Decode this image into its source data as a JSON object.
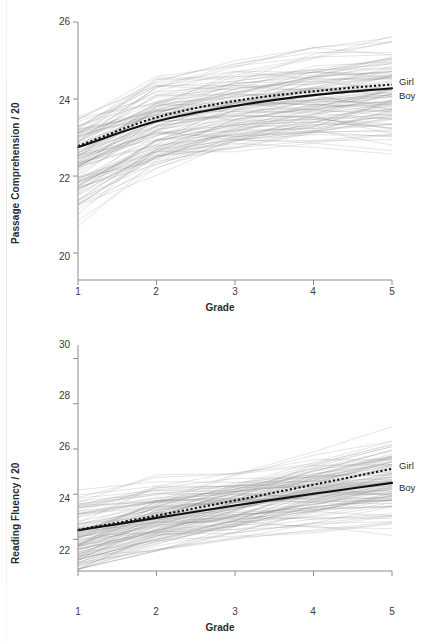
{
  "figure": {
    "background": "#ffffff",
    "line_color": "#111111",
    "spaghetti_color": "#8c8c8c",
    "axis_color": "#8d8d8d"
  },
  "chart_data": [
    {
      "type": "line",
      "panel": "top",
      "title": "",
      "xlabel": "Grade",
      "ylabel": "Passage Comprehension / 20",
      "xlim": [
        1,
        5
      ],
      "ylim": [
        19.3,
        26
      ],
      "xticks": [
        "1",
        "2",
        "3",
        "4",
        "5"
      ],
      "yticks": [
        "20",
        "22",
        "24",
        "26"
      ],
      "ytick_values": [
        20,
        22,
        24,
        26
      ],
      "xtick_values": [
        1,
        2,
        3,
        4,
        5
      ],
      "grid": false,
      "legend_position": "right-outside",
      "x": [
        1,
        2,
        3,
        4,
        5
      ],
      "series": [
        {
          "name": "Girl",
          "style": "dotted",
          "values": [
            22.78,
            23.52,
            23.95,
            24.2,
            24.38
          ]
        },
        {
          "name": "Boy",
          "style": "solid",
          "values": [
            22.75,
            23.42,
            23.82,
            24.1,
            24.28
          ]
        }
      ],
      "individual_trajectories_note": "faint grey spaghetti lines, one per pupil, grades 1-5",
      "n_trajectories": 120
    },
    {
      "type": "line",
      "panel": "bottom",
      "title": "",
      "xlabel": "Grade",
      "ylabel": "Reading Fluency / 20",
      "xlim": [
        1,
        5
      ],
      "ylim": [
        20.6,
        30.6
      ],
      "xticks": [
        "1",
        "2",
        "3",
        "4",
        "5"
      ],
      "yticks": [
        "22",
        "24",
        "26",
        "28",
        "30"
      ],
      "ytick_values": [
        22,
        24,
        26,
        28,
        30
      ],
      "xtick_values": [
        1,
        2,
        3,
        4,
        5
      ],
      "grid": false,
      "legend_position": "right-outside",
      "x": [
        1,
        2,
        3,
        4,
        5
      ],
      "series": [
        {
          "name": "Girl",
          "style": "dotted",
          "values": [
            22.42,
            23.05,
            23.72,
            24.42,
            25.12
          ]
        },
        {
          "name": "Boy",
          "style": "solid",
          "values": [
            22.4,
            22.95,
            23.5,
            24.02,
            24.5
          ]
        }
      ],
      "individual_trajectories_note": "faint grey spaghetti lines, one per pupil, grades 1-5",
      "n_trajectories": 120
    }
  ],
  "panel_top": {
    "ylabel": "Passage Comprehension / 20",
    "xlabel": "Grade",
    "yticks": [
      "26",
      "24",
      "22",
      "20"
    ],
    "xticks": [
      "1",
      "2",
      "3",
      "4",
      "5"
    ],
    "legend": {
      "girl": "Girl",
      "boy": "Boy"
    }
  },
  "panel_bottom": {
    "ylabel": "Reading Fluency / 20",
    "xlabel": "Grade",
    "yticks": [
      "30",
      "28",
      "26",
      "24",
      "22"
    ],
    "xticks": [
      "1",
      "2",
      "3",
      "4",
      "5"
    ],
    "legend": {
      "girl": "Girl",
      "boy": "Boy"
    }
  }
}
